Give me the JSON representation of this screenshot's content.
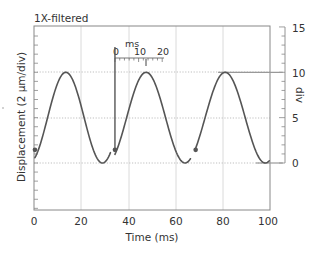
{
  "chart_data": {
    "type": "line",
    "title": "1X-filtered",
    "xlabel": "Time (ms)",
    "ylabel": "Displacement (2 μm/div)",
    "y2label": "div",
    "xlim": [
      0,
      100
    ],
    "ylim": [
      -4,
      16.5
    ],
    "xticks": [
      0,
      20,
      40,
      60,
      80,
      100
    ],
    "xtick_labels": [
      "0",
      "20",
      "40",
      "60",
      "80",
      "100"
    ],
    "y2ticks": [
      0,
      5,
      10,
      15
    ],
    "y2tick_labels": [
      "0",
      "5",
      "10",
      "15"
    ],
    "grid": {
      "vertical": [
        20,
        40,
        60,
        80
      ],
      "horizontal_dotted": [
        0,
        5,
        10
      ]
    },
    "scale_bar": {
      "label": "ms",
      "ticks": [
        "0",
        "10",
        "20"
      ],
      "range_ms": [
        0,
        20
      ]
    },
    "series": [
      {
        "name": "segment-1",
        "x": [
          0.4,
          4,
          8,
          13.5,
          19,
          24,
          29,
          32.5
        ],
        "values": [
          1.45,
          5.0,
          8.5,
          10.0,
          7.0,
          2.5,
          0.0,
          0.6
        ]
      },
      {
        "name": "segment-2",
        "x": [
          34.3,
          38,
          42,
          47.5,
          53,
          58,
          64,
          66.5
        ],
        "values": [
          1.45,
          5.0,
          8.5,
          10.0,
          7.0,
          2.5,
          0.0,
          0.6
        ]
      },
      {
        "name": "segment-3",
        "x": [
          68.5,
          72,
          76,
          81,
          87,
          92,
          98,
          100
        ],
        "values": [
          1.45,
          5.0,
          8.5,
          10.0,
          7.0,
          2.5,
          0.0,
          0.5
        ]
      }
    ],
    "markers": [
      {
        "x": 0.4,
        "y": 1.45
      },
      {
        "x": 34.3,
        "y": 1.45
      },
      {
        "x": 68.5,
        "y": 1.45
      }
    ],
    "reference_lines": [
      {
        "type": "vertical",
        "x": 34.3,
        "from": 1.45,
        "to": 13.0
      },
      {
        "type": "horizontal",
        "y": 10,
        "from_x": 78,
        "to_x": 105
      },
      {
        "type": "horizontal",
        "y": 0,
        "from_x": 94,
        "to_x": 105
      }
    ]
  }
}
